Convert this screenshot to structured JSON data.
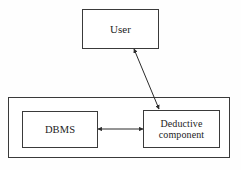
{
  "diagram": {
    "background_color": "#fefefe",
    "line_color": "#2b2b2b",
    "box_border_color": "#3a3a3a",
    "box_fill_color": "#ffffff",
    "nodes": [
      {
        "id": "user",
        "label": "User",
        "x": 82,
        "y": 9,
        "width": 77,
        "height": 40
      },
      {
        "id": "dbms",
        "label": "DBMS",
        "x": 22,
        "y": 111,
        "width": 76,
        "height": 37
      },
      {
        "id": "deductive",
        "label": "Deductive\ncomponent",
        "x": 143,
        "y": 110,
        "width": 77,
        "height": 38
      }
    ],
    "container": {
      "id": "system-boundary",
      "label": "",
      "x": 8,
      "y": 97,
      "width": 222,
      "height": 61,
      "contains": [
        "dbms",
        "deductive"
      ]
    },
    "connectors": [
      {
        "id": "user-deductive",
        "from": "user",
        "to": "deductive",
        "style": "double-arrow",
        "orientation": "diagonal",
        "x1": 134,
        "y1": 49,
        "x2": 159,
        "y2": 109
      },
      {
        "id": "dbms-deductive",
        "from": "dbms",
        "to": "deductive",
        "style": "double-arrow",
        "orientation": "horizontal",
        "x1": 98,
        "y1": 129,
        "x2": 143,
        "y2": 129
      }
    ]
  }
}
